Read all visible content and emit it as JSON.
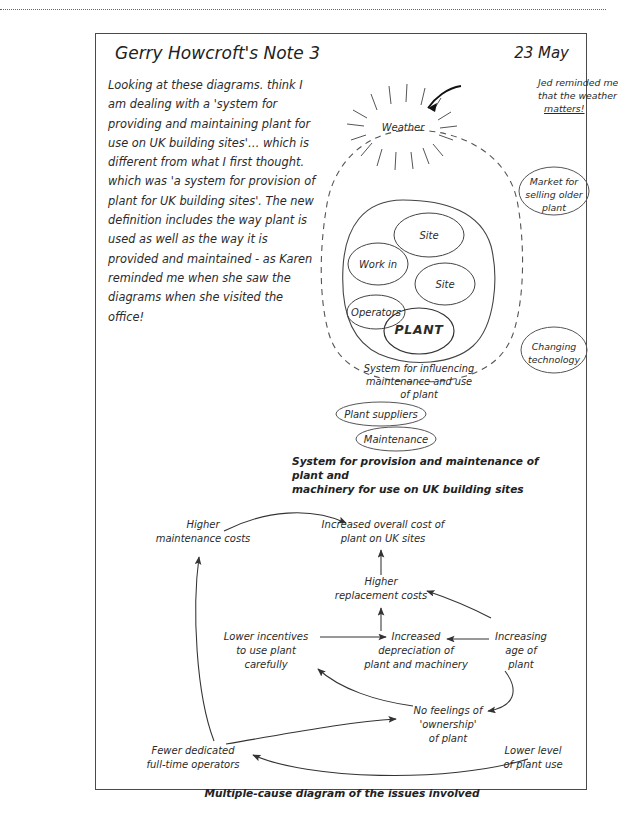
{
  "page": {
    "title": "Gerry Howcroft's Note 3",
    "date": "23 May",
    "body": "Looking at these diagrams. think I am dealing with a 'system for providing and maintaining plant for use on UK building sites'… which is different from what I first thought. which was 'a system for provision of plant for UK building sites'. The new definition includes the way plant is used as well as the way it is provided and maintained - as Karen reminded me when she saw the diagrams when she visited the office!"
  },
  "system_diagram": {
    "annotation": {
      "line1": "Jed reminded me",
      "line2": "that the weather",
      "line3": "matters!"
    },
    "weather_label": "Weather",
    "inner_ovals": [
      {
        "label": "Site"
      },
      {
        "label": "Work in"
      },
      {
        "label": "Site"
      },
      {
        "label": "Operators"
      },
      {
        "label": "PLANT"
      }
    ],
    "inner_boundary_label": {
      "line1": "System for influencing",
      "line2": "maintenance and use",
      "line3": "of plant"
    },
    "outside_ovals": [
      {
        "line1": "Market for",
        "line2": "selling older",
        "line3": "plant"
      },
      {
        "line1": "Changing",
        "line2": "technology",
        "line3": ""
      }
    ],
    "below_ovals": [
      {
        "label": "Plant suppliers"
      },
      {
        "label": "Maintenance"
      }
    ],
    "caption": {
      "line1": "System for provision and maintenance of plant and",
      "line2": "machinery for use on UK building sites"
    }
  },
  "cause_diagram": {
    "caption": "Multiple-cause diagram of the issues involved",
    "nodes": [
      {
        "id": "higher-maintenance-costs",
        "line1": "Higher",
        "line2": "maintenance costs",
        "line3": ""
      },
      {
        "id": "increased-overall-cost",
        "line1": "Increased overall cost of",
        "line2": "plant on UK sites",
        "line3": ""
      },
      {
        "id": "higher-replacement-costs",
        "line1": "Higher",
        "line2": "replacement costs",
        "line3": ""
      },
      {
        "id": "lower-incentives",
        "line1": "Lower incentives",
        "line2": "to use plant",
        "line3": "carefully"
      },
      {
        "id": "increased-depreciation",
        "line1": "Increased",
        "line2": "depreciation of",
        "line3": "plant and machinery"
      },
      {
        "id": "increasing-age",
        "line1": "Increasing",
        "line2": "age of",
        "line3": "plant"
      },
      {
        "id": "no-feelings-ownership",
        "line1": "No feelings of",
        "line2": "'ownership'",
        "line3": "of plant"
      },
      {
        "id": "fewer-dedicated-operators",
        "line1": "Fewer dedicated",
        "line2": "full-time operators",
        "line3": ""
      },
      {
        "id": "lower-level-plant-use",
        "line1": "Lower level",
        "line2": "of plant use",
        "line3": ""
      }
    ],
    "edges": [
      {
        "from": "higher-maintenance-costs",
        "to": "increased-overall-cost"
      },
      {
        "from": "higher-replacement-costs",
        "to": "increased-overall-cost"
      },
      {
        "from": "increased-depreciation",
        "to": "higher-replacement-costs"
      },
      {
        "from": "increasing-age",
        "to": "higher-replacement-costs"
      },
      {
        "from": "lower-incentives",
        "to": "increased-depreciation"
      },
      {
        "from": "increasing-age",
        "to": "increased-depreciation"
      },
      {
        "from": "no-feelings-ownership",
        "to": "lower-incentives"
      },
      {
        "from": "fewer-dedicated-operators",
        "to": "no-feelings-ownership"
      },
      {
        "from": "fewer-dedicated-operators",
        "to": "higher-maintenance-costs"
      },
      {
        "from": "lower-level-plant-use",
        "to": "fewer-dedicated-operators"
      },
      {
        "from": "increasing-age",
        "to": "no-feelings-ownership"
      }
    ]
  },
  "colors": {
    "ink": "#2b2b2b",
    "line": "#4a4a4a",
    "paper": "#ffffff"
  }
}
